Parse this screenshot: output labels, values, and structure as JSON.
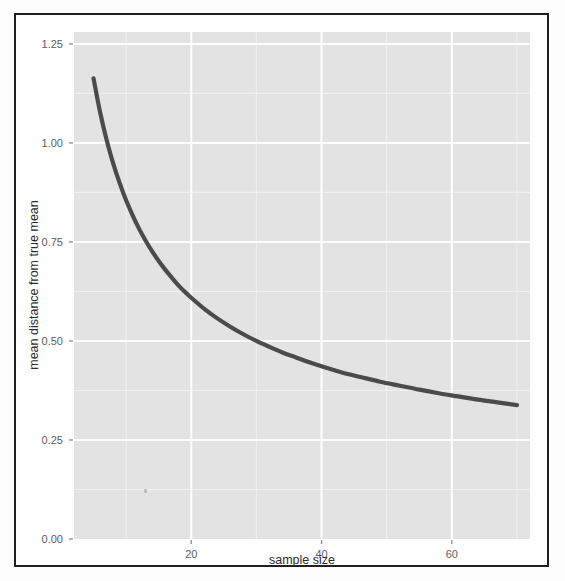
{
  "figure": {
    "background_color": "#ffffff",
    "frame_color": "#231f20",
    "panel_color": "#e3e3e3",
    "major_grid_color": "#ffffff",
    "minor_grid_color": "#f0f0f0",
    "line_color": "#4b4b4b"
  },
  "chart_data": {
    "type": "line",
    "title": "",
    "subtitle": "",
    "xlabel": "sample size",
    "ylabel": "mean distance from true mean",
    "xlim": [
      2,
      72
    ],
    "ylim": [
      0.0,
      1.28
    ],
    "x_ticks": [
      20,
      40,
      60
    ],
    "x_tick_labels": [
      "20",
      "40",
      "60"
    ],
    "y_ticks": [
      0.0,
      0.25,
      0.5,
      0.75,
      1.0,
      1.25
    ],
    "y_tick_labels": [
      "0.00",
      "0.25",
      "0.50",
      "0.75",
      "1.00",
      "1.25"
    ],
    "x_minor_ticks": [
      10,
      30,
      50,
      70
    ],
    "y_minor_ticks": [
      0.125,
      0.375,
      0.625,
      0.875,
      1.125
    ],
    "grid": true,
    "legend": "none",
    "series": [
      {
        "name": "mean distance from true mean",
        "x": [
          5,
          6,
          7,
          8,
          9,
          10,
          11,
          12,
          13,
          14,
          15,
          16,
          17,
          18,
          19,
          20,
          22,
          24,
          26,
          28,
          30,
          32,
          34,
          36,
          38,
          40,
          43,
          46,
          49,
          52,
          55,
          58,
          61,
          64,
          67,
          70
        ],
        "values": [
          1.163,
          1.078,
          1.008,
          0.949,
          0.899,
          0.855,
          0.817,
          0.783,
          0.753,
          0.726,
          0.702,
          0.68,
          0.66,
          0.641,
          0.624,
          0.609,
          0.581,
          0.557,
          0.536,
          0.517,
          0.5,
          0.485,
          0.471,
          0.459,
          0.447,
          0.436,
          0.421,
          0.409,
          0.397,
          0.387,
          0.377,
          0.368,
          0.36,
          0.352,
          0.345,
          0.338
        ]
      }
    ],
    "annotations": []
  },
  "axes": {
    "y_title": "mean distance from true mean",
    "x_title": "sample size"
  }
}
